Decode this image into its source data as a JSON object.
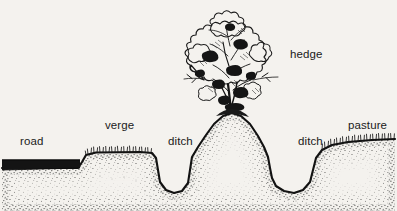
{
  "figure": {
    "caption": "(d) Double Ditched",
    "kind": "cross-section-diagram",
    "background_color": "#f4f2ee",
    "ink_color": "#111111"
  },
  "labels": {
    "road": "road",
    "verge": "verge",
    "ditch_left": "ditch",
    "hedge": "hedge",
    "ditch_right": "ditch",
    "pasture": "pasture"
  },
  "features": [
    {
      "name": "road",
      "description": "solid dark flat road surface at left"
    },
    {
      "name": "verge",
      "description": "raised grassy verge between road and first ditch"
    },
    {
      "name": "ditch-left",
      "description": "U-shaped stippled ditch"
    },
    {
      "name": "bank",
      "description": "central raised earth bank carrying the hedge"
    },
    {
      "name": "hedge",
      "description": "bushy sketched hedge on top of the bank"
    },
    {
      "name": "ditch-right",
      "description": "second U-shaped stippled ditch"
    },
    {
      "name": "pasture",
      "description": "grassy pasture sloping away at right"
    }
  ]
}
